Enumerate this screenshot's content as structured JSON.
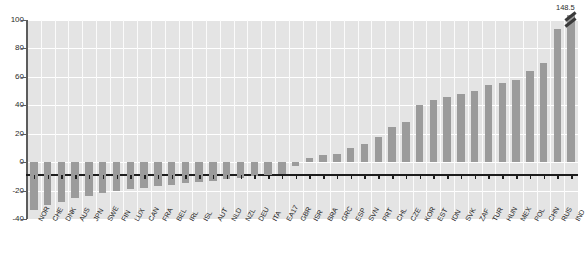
{
  "chart_data": {
    "type": "bar",
    "title": "",
    "subtitle": "",
    "xlabel": "",
    "ylabel": "",
    "ylim": [
      -40,
      100
    ],
    "yticks": [
      -40,
      -20,
      0,
      20,
      40,
      60,
      80,
      100
    ],
    "ytick_labels": [
      "-40",
      "-20",
      "0",
      "20",
      "40",
      "60",
      "80",
      "100"
    ],
    "grid": true,
    "legend": null,
    "bar_color": "#9b9b9b",
    "plot_background": "#e4e4e4",
    "gridline_color": "#ffffff",
    "axis_color": "#1d1d1d",
    "annotations": [
      {
        "label": "148.5",
        "category": "IND",
        "note": "bar truncated with axis break mark"
      }
    ],
    "categories": [
      "NOR",
      "CHE",
      "DNK",
      "AUS",
      "JPN",
      "SWE",
      "FIN",
      "LUX",
      "CAN",
      "FRA",
      "BEL",
      "IRL",
      "ISL",
      "AUT",
      "NLD",
      "NZL",
      "DEU",
      "ITA",
      "EA17",
      "GBR",
      "ISR",
      "BRA",
      "GRC",
      "ESP",
      "SVN",
      "PRT",
      "CHL",
      "CZE",
      "KOR",
      "EST",
      "IDN",
      "SVK",
      "ZAF",
      "TUR",
      "HUN",
      "MEX",
      "POL",
      "CHN",
      "RUS",
      "IND"
    ],
    "values": [
      -34,
      -30,
      -28,
      -25,
      -24,
      -22,
      -20,
      -19,
      -18,
      -17,
      -16,
      -15,
      -14,
      -13,
      -12,
      -11,
      -10,
      -9,
      -8,
      -3,
      3,
      5,
      6,
      10,
      13,
      18,
      25,
      28,
      40,
      44,
      46,
      48,
      50,
      54,
      56,
      58,
      64,
      70,
      94,
      148.5
    ],
    "value_display_cap": 100
  },
  "axis": {
    "y_tick_labels": [
      "100",
      "80",
      "60",
      "40",
      "20",
      "0",
      "-20",
      "-40"
    ]
  }
}
